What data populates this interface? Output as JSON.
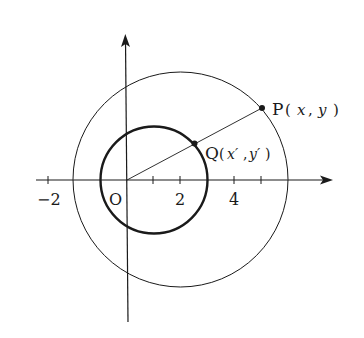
{
  "diagram": {
    "type": "coordinate-geometry",
    "axes": {
      "x_tick_labels": [
        "−2",
        "2",
        "4"
      ],
      "origin_label": "O",
      "ticks_at": [
        -2,
        1,
        2,
        4,
        5
      ]
    },
    "circles": [
      {
        "name": "outer",
        "center": [
          2,
          0
        ],
        "radius": 4,
        "style": "thin"
      },
      {
        "name": "inner",
        "center": [
          1,
          0
        ],
        "radius": 2,
        "style": "bold"
      }
    ],
    "points": {
      "P": {
        "label_name": "P",
        "label_args": "(x, y)",
        "x": "x",
        "y": "y"
      },
      "Q": {
        "label_name": "Q",
        "label_args": "(x′, y′)",
        "x": "x′",
        "y": "y′"
      }
    },
    "labels": {
      "neg2": "−2",
      "origin": "O",
      "two": "2",
      "four": "4",
      "P_letter": "P",
      "P_open": "(",
      "P_x": "x",
      "P_comma": ",",
      "P_y": "y",
      "P_close": ")",
      "Q_letter": "Q",
      "Q_open": "(",
      "Q_x": "x′",
      "Q_comma": ",",
      "Q_y": "y′",
      "Q_close": ")"
    },
    "colors": {
      "stroke": "#1a1a1a",
      "background": "#ffffff"
    }
  }
}
